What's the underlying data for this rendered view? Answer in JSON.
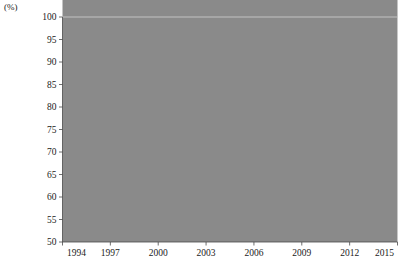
{
  "chart_data": {
    "type": "area",
    "title": "",
    "subtitle": "",
    "xlabel": "",
    "ylabel": "",
    "unit_label": "(%)",
    "x": [
      1994,
      1997,
      2000,
      2003,
      2006,
      2009,
      2012,
      2015
    ],
    "categories": [
      "1994",
      "1997",
      "2000",
      "2003",
      "2006",
      "2009",
      "2012",
      "2015"
    ],
    "xtick_labels": [
      "1994",
      "1997",
      "2000",
      "2003",
      "2006",
      "2009",
      "2012",
      "2015"
    ],
    "ytick_labels": [
      "50",
      "55",
      "60",
      "65",
      "70",
      "75",
      "80",
      "85",
      "90",
      "95",
      "100"
    ],
    "ytick_values": [
      50,
      55,
      60,
      65,
      70,
      75,
      80,
      85,
      90,
      95,
      100
    ],
    "ylim": [
      50,
      100
    ],
    "xlim": [
      1994,
      2015
    ],
    "grid": false,
    "legend": "none",
    "stacked": true,
    "stack_order": "bottom-to-top",
    "series": [
      {
        "name": "series-1-dark-gray",
        "color": "#8a8a8a",
        "values": [
          88.6,
          88.6,
          80.2,
          74.0,
          66.6,
          66.6,
          68.6,
          58.2
        ]
      },
      {
        "name": "series-2-light-gray",
        "color": "#d7d7d7",
        "values": [
          0.3,
          0.4,
          1.3,
          2.6,
          7.8,
          8.4,
          9.0,
          7.8
        ]
      },
      {
        "name": "series-3-black",
        "color": "#1a1a1a",
        "values": [
          1.1,
          1.0,
          1.3,
          1.5,
          1.5,
          1.8,
          2.9,
          3.0
        ]
      },
      {
        "name": "series-4-white",
        "color": "#f7f7f7",
        "values": [
          2.7,
          3.2,
          4.0,
          4.5,
          4.6,
          4.5,
          4.8,
          5.2
        ]
      },
      {
        "name": "series-5-top-light-gray",
        "color": "#cfcfcf",
        "values": [
          7.3,
          6.8,
          13.2,
          17.4,
          19.5,
          18.7,
          14.7,
          25.8
        ]
      }
    ],
    "cumulative_boundaries": {
      "top_of_dark_gray": [
        88.6,
        88.6,
        80.2,
        74.0,
        66.6,
        66.6,
        68.6,
        58.2
      ],
      "top_of_light_gray": [
        88.9,
        89.0,
        81.5,
        76.6,
        74.4,
        75.0,
        77.6,
        66.0
      ],
      "top_of_black": [
        90.0,
        90.0,
        82.8,
        78.1,
        75.9,
        76.8,
        80.5,
        69.0
      ],
      "top_of_white": [
        92.7,
        93.2,
        86.8,
        82.6,
        80.5,
        81.3,
        85.3,
        74.2
      ],
      "top_of_chart": [
        100,
        100,
        100,
        100,
        100,
        100,
        100,
        100
      ]
    }
  },
  "axes": {
    "y_unit": "(%)",
    "y_min_label": "50",
    "y_max_label": "100"
  }
}
